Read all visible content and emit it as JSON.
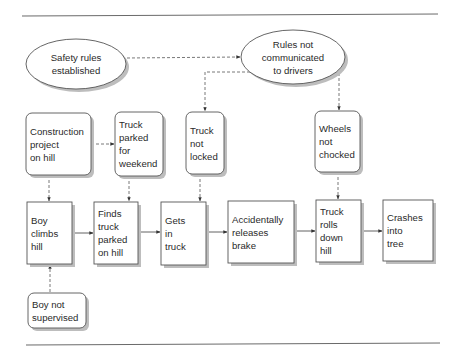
{
  "diagram": {
    "type": "causal-flow-diagram",
    "nodes": [
      {
        "id": "safety_rules",
        "shape": "ellipse",
        "lines": [
          "Safety rules",
          "established"
        ]
      },
      {
        "id": "rules_not_communicated",
        "shape": "ellipse",
        "lines": [
          "Rules not",
          "communicated",
          "to drivers"
        ]
      },
      {
        "id": "construction_project",
        "shape": "rounded-rect",
        "lines": [
          "Construction",
          "project",
          "on hill"
        ]
      },
      {
        "id": "truck_parked_weekend",
        "shape": "rounded-rect",
        "lines": [
          "Truck",
          "parked",
          "for",
          "weekend"
        ]
      },
      {
        "id": "truck_not_locked",
        "shape": "rounded-rect",
        "lines": [
          "Truck",
          "not",
          "locked"
        ]
      },
      {
        "id": "wheels_not_chocked",
        "shape": "rounded-rect",
        "lines": [
          "Wheels",
          "not",
          "chocked"
        ]
      },
      {
        "id": "boy_climbs_hill",
        "shape": "rect",
        "lines": [
          "Boy",
          "climbs",
          "hill"
        ]
      },
      {
        "id": "finds_truck",
        "shape": "rect",
        "lines": [
          "Finds",
          "truck",
          "parked",
          "on hill"
        ]
      },
      {
        "id": "gets_in_truck",
        "shape": "rect",
        "lines": [
          "Gets",
          "in",
          "truck"
        ]
      },
      {
        "id": "releases_brake",
        "shape": "rect",
        "lines": [
          "Accidentally",
          "releases",
          "brake"
        ]
      },
      {
        "id": "truck_rolls",
        "shape": "rect",
        "lines": [
          "Truck",
          "rolls",
          "down",
          "hill"
        ]
      },
      {
        "id": "crashes_into_tree",
        "shape": "rect",
        "lines": [
          "Crashes",
          "into",
          "tree"
        ]
      },
      {
        "id": "boy_not_supervised",
        "shape": "rounded-rect",
        "lines": [
          "Boy not",
          "supervised"
        ]
      }
    ],
    "edges": [
      {
        "from": "safety_rules",
        "to": "rules_not_communicated",
        "style": "dashed"
      },
      {
        "from": "rules_not_communicated",
        "to": "truck_not_locked",
        "style": "dashed"
      },
      {
        "from": "rules_not_communicated",
        "to": "wheels_not_chocked",
        "style": "dashed"
      },
      {
        "from": "construction_project",
        "to": "truck_parked_weekend",
        "style": "dashed"
      },
      {
        "from": "construction_project",
        "to": "boy_climbs_hill",
        "style": "dashed"
      },
      {
        "from": "truck_parked_weekend",
        "to": "finds_truck",
        "style": "dashed"
      },
      {
        "from": "truck_not_locked",
        "to": "gets_in_truck",
        "style": "dashed"
      },
      {
        "from": "wheels_not_chocked",
        "to": "truck_rolls",
        "style": "dashed"
      },
      {
        "from": "boy_not_supervised",
        "to": "boy_climbs_hill",
        "style": "dashed"
      },
      {
        "from": "boy_climbs_hill",
        "to": "finds_truck",
        "style": "solid"
      },
      {
        "from": "finds_truck",
        "to": "gets_in_truck",
        "style": "solid"
      },
      {
        "from": "gets_in_truck",
        "to": "releases_brake",
        "style": "solid"
      },
      {
        "from": "releases_brake",
        "to": "truck_rolls",
        "style": "solid"
      },
      {
        "from": "truck_rolls",
        "to": "crashes_into_tree",
        "style": "solid"
      }
    ]
  }
}
